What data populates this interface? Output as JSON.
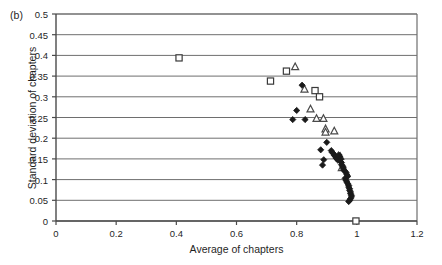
{
  "panel": {
    "label": "(b)"
  },
  "chart_data": {
    "type": "scatter",
    "title": "",
    "panel_label": "(b)",
    "xlabel": "Average of chapters",
    "ylabel": "Standard deviation of chapters",
    "xlim": [
      0,
      1.2
    ],
    "ylim": [
      0,
      0.5
    ],
    "xticks": [
      0,
      0.2,
      0.4,
      0.6,
      0.8,
      1,
      1.2
    ],
    "xtick_labels": [
      "0",
      "0.2",
      "0.4",
      "0.6",
      "0.8",
      "1",
      "1.2"
    ],
    "yticks": [
      0,
      0.05,
      0.1,
      0.15,
      0.2,
      0.25,
      0.3,
      0.35,
      0.4,
      0.45,
      0.5
    ],
    "ytick_labels": [
      "0",
      "0.05",
      "0.1",
      "0.15",
      "0.2",
      "0.25",
      "0.3",
      "0.35",
      "0.4",
      "0.45",
      "0.5"
    ],
    "grid": "horizontal",
    "legend": "none",
    "series": [
      {
        "name": "open-square",
        "marker": "square-open",
        "color": "#3a3a3a",
        "points": [
          [
            0.409,
            0.394
          ],
          [
            0.713,
            0.338
          ],
          [
            0.766,
            0.362
          ],
          [
            0.861,
            0.315
          ],
          [
            0.876,
            0.3
          ],
          [
            0.997,
            0.0
          ]
        ]
      },
      {
        "name": "open-triangle",
        "marker": "triangle-open",
        "color": "#4a4a4a",
        "points": [
          [
            0.795,
            0.372
          ],
          [
            0.826,
            0.318
          ],
          [
            0.846,
            0.27
          ],
          [
            0.866,
            0.247
          ],
          [
            0.889,
            0.247
          ],
          [
            0.896,
            0.222
          ],
          [
            0.896,
            0.214
          ],
          [
            0.925,
            0.217
          ],
          [
            0.945,
            0.155
          ],
          [
            0.95,
            0.128
          ]
        ]
      },
      {
        "name": "filled-diamond",
        "marker": "diamond-filled",
        "color": "#1a1a1a",
        "points": [
          [
            0.818,
            0.328
          ],
          [
            0.8,
            0.267
          ],
          [
            0.787,
            0.245
          ],
          [
            0.828,
            0.245
          ],
          [
            0.9,
            0.19
          ],
          [
            0.88,
            0.172
          ],
          [
            0.915,
            0.17
          ],
          [
            0.918,
            0.166
          ],
          [
            0.922,
            0.163
          ],
          [
            0.925,
            0.159
          ],
          [
            0.928,
            0.156
          ],
          [
            0.931,
            0.152
          ],
          [
            0.934,
            0.15
          ],
          [
            0.937,
            0.147
          ],
          [
            0.94,
            0.16
          ],
          [
            0.943,
            0.156
          ],
          [
            0.946,
            0.15
          ],
          [
            0.946,
            0.144
          ],
          [
            0.949,
            0.141
          ],
          [
            0.89,
            0.148
          ],
          [
            0.886,
            0.135
          ],
          [
            0.949,
            0.136
          ],
          [
            0.952,
            0.133
          ],
          [
            0.955,
            0.13
          ],
          [
            0.955,
            0.126
          ],
          [
            0.958,
            0.122
          ],
          [
            0.961,
            0.12
          ],
          [
            0.964,
            0.117
          ],
          [
            0.967,
            0.112
          ],
          [
            0.97,
            0.108
          ],
          [
            0.961,
            0.103
          ],
          [
            0.964,
            0.098
          ],
          [
            0.967,
            0.094
          ],
          [
            0.97,
            0.09
          ],
          [
            0.973,
            0.086
          ],
          [
            0.973,
            0.082
          ],
          [
            0.976,
            0.078
          ],
          [
            0.976,
            0.074
          ],
          [
            0.979,
            0.07
          ],
          [
            0.979,
            0.066
          ],
          [
            0.982,
            0.062
          ],
          [
            0.982,
            0.058
          ],
          [
            0.979,
            0.054
          ],
          [
            0.976,
            0.05
          ],
          [
            0.973,
            0.047
          ]
        ]
      }
    ]
  }
}
